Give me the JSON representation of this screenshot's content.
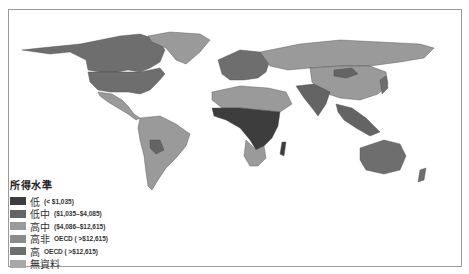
{
  "legend": {
    "title": "所得水準",
    "items": [
      {
        "label": "低",
        "range": "(< $1,035)",
        "color": "#3d3d3d"
      },
      {
        "label": "低中",
        "range": "($1,035–$4,085)",
        "color": "#646464"
      },
      {
        "label": "高中",
        "range": "($4,086–$12,615)",
        "color": "#9a9a9a"
      },
      {
        "label": "高非",
        "range": "OECD ( >$12,615)",
        "color": "#8c8c8c"
      },
      {
        "label": "高",
        "range": "OECD ( >$12,615)",
        "color": "#6e6e6e"
      },
      {
        "label": "無資料",
        "range": "",
        "color": "#a8a8a8"
      }
    ]
  },
  "map": {
    "type": "world choropleth",
    "subject": "income level by country",
    "colors": {
      "low": "#3d3d3d",
      "lower_middle": "#646464",
      "upper_middle": "#9a9a9a",
      "high_non_oecd": "#8c8c8c",
      "high_oecd": "#6e6e6e",
      "no_data": "#a8a8a8",
      "border": "#555555",
      "ocean": "#ffffff"
    }
  }
}
